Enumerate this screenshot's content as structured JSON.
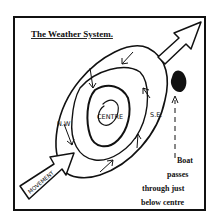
{
  "diagram": {
    "title": "The Weather System.",
    "labels": {
      "centre": "CENTRE",
      "nw": "N.W",
      "se": "S.E.",
      "movement": "MOVEMENT"
    },
    "boat_note": [
      "Boat",
      "passes",
      "through just",
      "below centre"
    ],
    "icons": {
      "movement_arrow": "hollow-arrow-icon",
      "exit_arrow": "hollow-arrow-icon",
      "boat": "boat-blob-icon",
      "boat_path": "dashed-arrow-icon"
    },
    "colors": {
      "ink": "#111111",
      "background": "#ffffff"
    }
  }
}
